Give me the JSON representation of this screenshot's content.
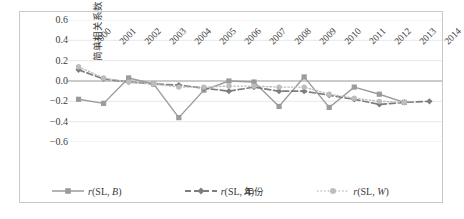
{
  "axes": {
    "y_title": "简单相关系数",
    "x_title": "年份",
    "y_ticks": [
      "0.6",
      "0.4",
      "0.2",
      "0.0",
      "−0.2",
      "−0.4",
      "−0.6"
    ]
  },
  "legend": {
    "items": [
      {
        "label": "r(SL, B)",
        "style": "solid",
        "marker": "square",
        "color": "#9b9b9b"
      },
      {
        "label": "r(SL, A)",
        "style": "dashed",
        "marker": "diamond",
        "color": "#7d7d7d"
      },
      {
        "label": "r(SL, W)",
        "style": "dotted",
        "marker": "circle",
        "color": "#bdbdbd"
      }
    ]
  },
  "chart_data": {
    "type": "line",
    "title": "",
    "xlabel": "年份",
    "ylabel": "简单相关系数",
    "categories": [
      "2000",
      "2001",
      "2002",
      "2003",
      "2004",
      "2005",
      "2006",
      "2007",
      "2008",
      "2009",
      "2010",
      "2011",
      "2012",
      "2013",
      "2014"
    ],
    "ylim": [
      -0.6,
      0.6
    ],
    "yticks": [
      0.6,
      0.4,
      0.2,
      0.0,
      -0.2,
      -0.4,
      -0.6
    ],
    "grid": true,
    "legend_position": "bottom",
    "series": [
      {
        "name": "r(SL, B)",
        "color": "#9b9b9b",
        "linestyle": "solid",
        "marker": "square",
        "values": [
          -0.18,
          -0.22,
          0.03,
          -0.03,
          -0.36,
          -0.09,
          0.0,
          -0.01,
          -0.25,
          0.04,
          -0.26,
          -0.06,
          -0.13,
          -0.21,
          null
        ]
      },
      {
        "name": "r(SL, A)",
        "color": "#7d7d7d",
        "linestyle": "dashed",
        "marker": "diamond",
        "values": [
          0.11,
          0.02,
          -0.01,
          -0.03,
          -0.04,
          -0.07,
          -0.1,
          -0.06,
          -0.1,
          -0.1,
          -0.14,
          -0.18,
          -0.23,
          -0.21,
          -0.2
        ]
      },
      {
        "name": "r(SL, W)",
        "color": "#bdbdbd",
        "linestyle": "dotted",
        "marker": "circle",
        "values": [
          0.14,
          0.03,
          -0.01,
          -0.03,
          -0.06,
          -0.06,
          -0.05,
          -0.05,
          -0.06,
          -0.06,
          -0.13,
          -0.17,
          -0.2,
          -0.21,
          null
        ]
      }
    ]
  }
}
